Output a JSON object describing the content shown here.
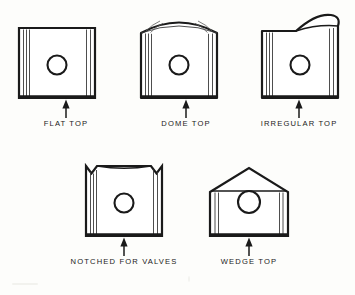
{
  "figure": {
    "background_color": "#fdfdfb",
    "ink_color": "#1a1a1a",
    "groove_color": "#3a3a3a"
  },
  "pistons": [
    {
      "id": "flat-top",
      "label": "FLAT TOP",
      "crown_type": "flat",
      "label_x": 66,
      "label_y": 124,
      "body": {
        "x": 19,
        "y": 28,
        "width": 76,
        "height": 70
      },
      "pin_hole": {
        "cx": 57,
        "cy": 65,
        "r": 9.5
      },
      "arrow": {
        "x": 66,
        "y_tip": 100,
        "y_tail": 118
      },
      "left_grooves": [
        4.5,
        7.5,
        10.5
      ],
      "right_grooves": [
        4.5,
        8.5
      ]
    },
    {
      "id": "dome-top",
      "label": "DOME TOP",
      "crown_type": "dome",
      "label_x": 186,
      "label_y": 124,
      "body": {
        "x": 141,
        "y": 28,
        "width": 76,
        "height": 70
      },
      "pin_hole": {
        "cx": 179,
        "cy": 65,
        "r": 9.5
      },
      "arrow": {
        "x": 186,
        "y_tip": 100,
        "y_tail": 118
      },
      "left_grooves": [
        4.5,
        7.5,
        10.5
      ],
      "right_grooves": [
        4.5,
        8.5
      ],
      "dome_rise": 14
    },
    {
      "id": "irregular-top",
      "label": "IRREGULAR TOP",
      "crown_type": "irregular",
      "label_x": 299,
      "label_y": 124,
      "body": {
        "x": 262,
        "y": 28,
        "width": 76,
        "height": 70
      },
      "pin_hole": {
        "cx": 300,
        "cy": 65,
        "r": 9.5
      },
      "arrow": {
        "x": 299,
        "y_tip": 100,
        "y_tail": 118
      },
      "left_grooves": [
        4.5,
        7.5,
        10.5
      ],
      "right_grooves": [
        4.5,
        8.5
      ],
      "lobe_rise": 16
    },
    {
      "id": "notched-for-valves",
      "label": "NOTCHED FOR VALVES",
      "crown_type": "notched",
      "label_x": 124,
      "label_y": 262,
      "body": {
        "x": 86,
        "y": 166,
        "width": 76,
        "height": 70
      },
      "pin_hole": {
        "cx": 124,
        "cy": 203,
        "r": 9.5
      },
      "arrow": {
        "x": 124,
        "y_tip": 238,
        "y_tail": 256
      },
      "left_grooves": [
        4.5,
        7.5,
        10.5
      ],
      "right_grooves": [
        4.5,
        8.5
      ],
      "notch_depth": 8
    },
    {
      "id": "wedge-top",
      "label": "WEDGE TOP",
      "crown_type": "wedge",
      "label_x": 249,
      "label_y": 262,
      "body": {
        "x": 210,
        "y": 168,
        "width": 78,
        "height": 68
      },
      "pin_hole": {
        "cx": 249,
        "cy": 202,
        "r": 11
      },
      "arrow": {
        "x": 249,
        "y_tip": 238,
        "y_tail": 256
      },
      "left_grooves": [
        5,
        8.5
      ],
      "right_grooves": [
        5,
        8.5
      ],
      "peak_rise": 24
    }
  ]
}
